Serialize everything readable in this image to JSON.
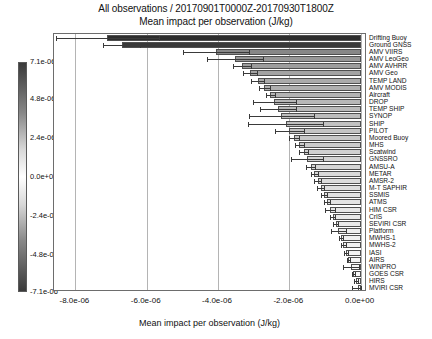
{
  "figure": {
    "title_line1": "All observations / 20170901T0000Z-20170930T1800Z",
    "title_line2": "Mean impact per observation (J/kg)",
    "xlabel": "Mean impact per observation (J/kg)",
    "bar_edge_color": "#4f4f4f",
    "grid_color": "#b4b4b4",
    "axes_color": "#6d6d6d"
  },
  "colorbar": {
    "name": "impact-colorbar",
    "top_color": "#3a3a3a",
    "mid_color": "#ffffff",
    "bottom_color": "#3a3a3a",
    "ticks": [
      {
        "label": "7.1e-06",
        "value": 7.1e-06
      },
      {
        "label": "4.8e-06",
        "value": 4.8e-06
      },
      {
        "label": "2.4e-06",
        "value": 2.4e-06
      },
      {
        "label": "0.0e+00",
        "value": 0.0
      },
      {
        "label": "-2.4e-06",
        "value": -2.4e-06
      },
      {
        "label": "-4.8e-06",
        "value": -4.8e-06
      },
      {
        "label": "-7.1e-06",
        "value": -7.1e-06
      }
    ],
    "vmin": -7.1e-06,
    "vmax": 7.1e-06
  },
  "xaxis": {
    "ticks": [
      "-8.0e-06",
      "-6.0e-06",
      "-4.0e-06",
      "-2.0e-06",
      "0.0e+00"
    ],
    "tick_values": [
      -8e-06,
      -6e-06,
      -4e-06,
      -2e-06,
      0.0
    ],
    "min": -8.6e-06,
    "max": 1.8e-07
  },
  "chart_data": {
    "type": "bar",
    "orientation": "horizontal",
    "title": "All observations / 20170901T0000Z-20170930T1800Z\nMean impact per observation (J/kg)",
    "xlabel": "Mean impact per observation (J/kg)",
    "ylabel": "",
    "xlim": [
      -8.6e-06,
      1.8e-07
    ],
    "grid": true,
    "legend": "none",
    "colorbar_label": "Mean impact per observation (J/kg)",
    "categories": [
      "Drifting Buoy",
      "Ground GNSS",
      "AMV VIIRS",
      "AMV LeoGeo",
      "AMV AVHRR",
      "AMV Geo",
      "TEMP LAND",
      "AMV MODIS",
      "Aircraft",
      "DROP",
      "TEMP SHIP",
      "SYNOP",
      "SHIP",
      "PILOT",
      "Moored Buoy",
      "MHS",
      "Scatwind",
      "GNSSRO",
      "AMSU-A",
      "METAR",
      "AMSR-2",
      "M-T SAPHIR",
      "SSMIS",
      "ATMS",
      "HIM CSR",
      "CrIS",
      "SEVIRI CSR",
      "Platform",
      "MWHS-1",
      "MWHS-2",
      "IASI",
      "AIRS",
      "WINPRO",
      "GOES CSR",
      "HIRS",
      "MVIRI CSR"
    ],
    "values": [
      -7.1e-06,
      -6.7e-06,
      -4.05e-06,
      -3.52e-06,
      -3.32e-06,
      -3.1e-06,
      -2.88e-06,
      -2.7e-06,
      -2.53e-06,
      -2.42e-06,
      -2.32e-06,
      -2.22e-06,
      -2.1e-06,
      -2e-06,
      -1.88e-06,
      -1.72e-06,
      -1.6e-06,
      -1.5e-06,
      -1.4e-06,
      -1.3e-06,
      -1.2e-06,
      -1.12e-06,
      -1.03e-06,
      -9.5e-07,
      -8.6e-07,
      -7.8e-07,
      -7e-07,
      -6.2e-07,
      -5.5e-07,
      -4.8e-07,
      -4.1e-07,
      -3.4e-07,
      -2.7e-07,
      -2e-07,
      -1.3e-07,
      -7e-08
    ],
    "errors": [
      1.45e-06,
      5.2e-07,
      9.2e-07,
      7.8e-07,
      2.6e-07,
      2e-07,
      1.8e-07,
      1.6e-07,
      1.2e-07,
      6e-07,
      5e-07,
      9.2e-07,
      1.05e-06,
      4e-07,
      1.4e-07,
      1.2e-07,
      1.2e-07,
      4.5e-07,
      1.2e-07,
      1e-07,
      1e-07,
      9e-08,
      8e-08,
      8e-08,
      1.4e-07,
      7e-08,
      7e-08,
      2e-07,
      6e-08,
      6e-08,
      6e-08,
      5e-08,
      2.2e-07,
      5e-08,
      5e-08,
      1.8e-07
    ]
  }
}
